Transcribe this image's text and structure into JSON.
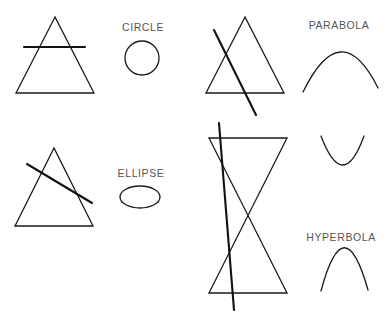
{
  "labels": {
    "circle": "CIRCLE",
    "ellipse": "ELLIPSE",
    "parabola": "PARABOLA",
    "hyperbola": "HYPERBOLA"
  },
  "colors": {
    "line": "#1a1a1a",
    "label": "#555555",
    "background": "#ffffff"
  },
  "figures": [
    {
      "name": "circle-section",
      "cone": "single",
      "plane": "horizontal",
      "result": "CIRCLE"
    },
    {
      "name": "ellipse-section",
      "cone": "single",
      "plane": "tilted",
      "result": "ELLIPSE"
    },
    {
      "name": "parabola-section",
      "cone": "single",
      "plane": "parallel-to-side",
      "result": "PARABOLA"
    },
    {
      "name": "hyperbola-section",
      "cone": "double",
      "plane": "near-vertical",
      "result": "HYPERBOLA"
    }
  ]
}
